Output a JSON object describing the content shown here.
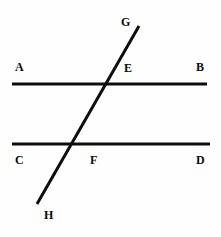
{
  "diagram": {
    "background_color": "#fefefe",
    "stroke_color": "#0d0d0d",
    "label_color": "#0a0a0a",
    "stroke_width": 3,
    "lines": [
      {
        "name": "line-AB",
        "role": "upper-parallel-line",
        "from_label": "A",
        "to_label": "B",
        "x1": 12,
        "y1": 84,
        "x2": 207,
        "y2": 84
      },
      {
        "name": "line-CD",
        "role": "lower-parallel-line",
        "from_label": "C",
        "to_label": "D",
        "x1": 12,
        "y1": 144,
        "x2": 210,
        "y2": 144
      },
      {
        "name": "line-GH",
        "role": "transversal-line",
        "from_label": "G",
        "to_label": "H",
        "x1": 139,
        "y1": 26,
        "x2": 37,
        "y2": 204
      }
    ],
    "intersections": [
      {
        "name": "point-E",
        "label": "E",
        "x": 107,
        "y": 84,
        "of": [
          "line-AB",
          "line-GH"
        ]
      },
      {
        "name": "point-F",
        "label": "F",
        "x": 72,
        "y": 144,
        "of": [
          "line-CD",
          "line-GH"
        ]
      }
    ],
    "labels": [
      {
        "name": "label-A",
        "text": "A",
        "x": 15,
        "y": 61,
        "anchor": "left-of-line-AB"
      },
      {
        "name": "label-B",
        "text": "B",
        "x": 196,
        "y": 61,
        "anchor": "right-of-line-AB"
      },
      {
        "name": "label-E",
        "text": "E",
        "x": 124,
        "y": 62,
        "anchor": "above-right-of-point-E"
      },
      {
        "name": "label-C",
        "text": "C",
        "x": 15,
        "y": 154,
        "anchor": "left-below-line-CD"
      },
      {
        "name": "label-F",
        "text": "F",
        "x": 90,
        "y": 154,
        "anchor": "below-right-of-point-F"
      },
      {
        "name": "label-D",
        "text": "D",
        "x": 196,
        "y": 154,
        "anchor": "right-below-line-CD"
      },
      {
        "name": "label-G",
        "text": "G",
        "x": 121,
        "y": 16,
        "anchor": "above-left-of-transversal-top"
      },
      {
        "name": "label-H",
        "text": "H",
        "x": 44,
        "y": 209,
        "anchor": "below-right-of-transversal-bottom"
      }
    ]
  }
}
